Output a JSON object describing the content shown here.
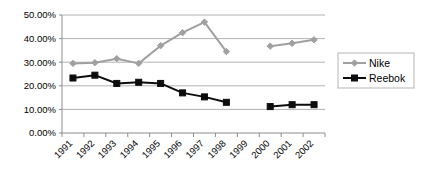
{
  "chart_data": {
    "type": "line",
    "title": "",
    "xlabel": "",
    "ylabel": "",
    "categories": [
      "1991",
      "1992",
      "1993",
      "1994",
      "1995",
      "1996",
      "1997",
      "1998",
      "1999",
      "2000",
      "2001",
      "2002"
    ],
    "ytick_labels": [
      "50.00%",
      "40.00%",
      "30.00%",
      "20.00%",
      "10.00%",
      "0.00%"
    ],
    "ytick_values": [
      50,
      40,
      30,
      20,
      10,
      0
    ],
    "ylim": [
      0,
      50
    ],
    "grid": "horizontal",
    "legend_position": "right",
    "series": [
      {
        "name": "Nike",
        "color": "#A0A0A0",
        "marker": "diamond",
        "values": [
          29.5,
          29.8,
          31.5,
          29.5,
          37.0,
          42.5,
          47.0,
          34.5,
          null,
          36.8,
          38.0,
          39.5
        ]
      },
      {
        "name": "Reebok",
        "color": "#0D0D0D",
        "marker": "square",
        "values": [
          23.3,
          24.5,
          21.0,
          21.5,
          21.0,
          17.0,
          15.3,
          13.0,
          null,
          11.2,
          12.0,
          12.0
        ]
      }
    ]
  },
  "legend": {
    "items": [
      {
        "label": "Nike"
      },
      {
        "label": "Reebok"
      }
    ]
  },
  "colors": {
    "nike": "#A0A0A0",
    "reebok": "#0D0D0D",
    "grid": "#9E9E9E",
    "axis": "#8C8C8C",
    "background": "#FFFFFF"
  }
}
